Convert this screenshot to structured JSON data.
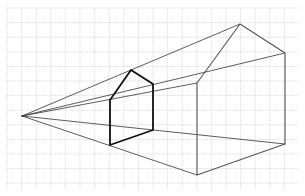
{
  "diagram": {
    "grid": {
      "x0": 7,
      "y0": 8,
      "x1": 298,
      "y1": 190,
      "spacing": 14.6,
      "color": "#c8c8c8"
    },
    "vanishing_point": {
      "x": 22,
      "y": 116
    },
    "small_house_front": {
      "points": [
        [
          110,
          100
        ],
        [
          131,
          70
        ],
        [
          153,
          84
        ],
        [
          153,
          130
        ],
        [
          110,
          145
        ]
      ],
      "color": "#111111",
      "width": 1.8
    },
    "large_house_front": {
      "points": [
        [
          197,
          83
        ],
        [
          240,
          24
        ],
        [
          285,
          53
        ],
        [
          285,
          144
        ],
        [
          197,
          175
        ]
      ],
      "color": "#555555",
      "width": 1.1
    },
    "projection_lines": {
      "color": "#333333",
      "width": 0.8,
      "targets": [
        [
          240,
          24
        ],
        [
          285,
          53
        ],
        [
          197,
          83
        ],
        [
          285,
          144
        ],
        [
          197,
          175
        ]
      ]
    }
  }
}
